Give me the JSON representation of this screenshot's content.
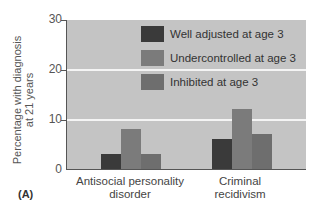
{
  "chart_data": {
    "type": "bar",
    "title": "",
    "panel_label": "(A)",
    "xlabel": "",
    "ylabel": "Percentage with diagnosis at 21 years",
    "ylabel_lines": [
      "Percentage with diagnosis",
      "at 21 years"
    ],
    "ylim": [
      0,
      30
    ],
    "yticks": [
      "0",
      "10",
      "20",
      "30"
    ],
    "grid": true,
    "legend_position": "upper center",
    "categories": [
      "Antisocial personality disorder",
      "Criminal recidivism"
    ],
    "category_lines": [
      [
        "Antisocial personality",
        "disorder"
      ],
      [
        "Criminal",
        "recidivism"
      ]
    ],
    "series": [
      {
        "name": "Well adjusted at age 3",
        "color": "#3a3a3a",
        "values": [
          3,
          6
        ]
      },
      {
        "name": "Undercontrolled at age 3",
        "color": "#7b7b7b",
        "values": [
          8,
          12
        ]
      },
      {
        "name": "Inhibited at age 3",
        "color": "#6e6e6e",
        "values": [
          3,
          7
        ]
      }
    ]
  }
}
